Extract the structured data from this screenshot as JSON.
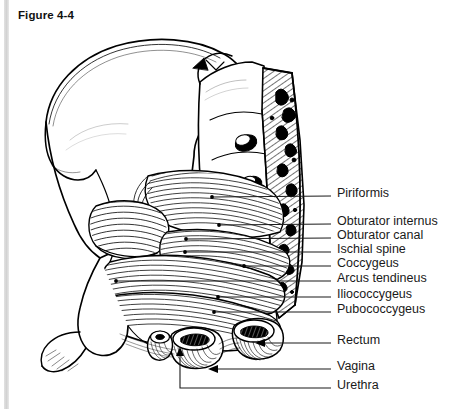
{
  "figure": {
    "title": "Figure 4-4",
    "background_color": "#ffffff",
    "ink_color": "#000000",
    "gutter_color": "#dcdcdc"
  },
  "labels": [
    {
      "id": "piriformis",
      "text": "Piriformis",
      "text_x": 337,
      "text_y": 196,
      "line_x1": 306,
      "line_y1": 196,
      "line_x2": 331,
      "line_y2": 196,
      "marker_x": 212,
      "marker_y": 197
    },
    {
      "id": "obturator-internus",
      "text": "Obturator internus",
      "text_x": 337,
      "text_y": 224,
      "line_x1": 300,
      "line_y1": 224,
      "line_x2": 331,
      "line_y2": 224,
      "marker_x": 219,
      "marker_y": 225
    },
    {
      "id": "obturator-canal",
      "text": "Obturator canal",
      "text_x": 337,
      "text_y": 238,
      "line_x1": 299,
      "line_y1": 238,
      "line_x2": 331,
      "line_y2": 238,
      "marker_x": 186,
      "marker_y": 239
    },
    {
      "id": "ischial-spine",
      "text": "Ischial spine",
      "text_x": 337,
      "text_y": 252,
      "line_x1": 298,
      "line_y1": 252,
      "line_x2": 331,
      "line_y2": 252,
      "marker_x": 185,
      "marker_y": 252
    },
    {
      "id": "coccygeus",
      "text": "Coccygeus",
      "text_x": 337,
      "text_y": 266,
      "line_x1": 298,
      "line_y1": 266,
      "line_x2": 331,
      "line_y2": 266,
      "marker_x": 244,
      "marker_y": 266
    },
    {
      "id": "arcus-tendineus",
      "text": "Arcus tendineus",
      "text_x": 337,
      "text_y": 281,
      "line_x1": 296,
      "line_y1": 281,
      "line_x2": 331,
      "line_y2": 281,
      "marker_x": 116,
      "marker_y": 281
    },
    {
      "id": "iliococcygeus",
      "text": "Iliococcygeus",
      "text_x": 337,
      "text_y": 297,
      "line_x1": 293,
      "line_y1": 297,
      "line_x2": 331,
      "line_y2": 297,
      "marker_x": 218,
      "marker_y": 297
    },
    {
      "id": "pubococcygeus",
      "text": "Pubococcygeus",
      "text_x": 337,
      "text_y": 312,
      "line_x1": 288,
      "line_y1": 312,
      "line_x2": 331,
      "line_y2": 312,
      "marker_x": 214,
      "marker_y": 312
    },
    {
      "id": "rectum",
      "text": "Rectum",
      "text_x": 337,
      "text_y": 343,
      "line_x1": 302,
      "line_y1": 343,
      "line_x2": 331,
      "line_y2": 343,
      "marker_x": 262,
      "marker_y": 343
    },
    {
      "id": "vagina",
      "text": "Vagina",
      "text_x": 337,
      "text_y": 369,
      "line_x1": 302,
      "line_y1": 369,
      "line_x2": 331,
      "line_y2": 369,
      "marker_x": 215,
      "marker_y": 369
    },
    {
      "id": "urethra",
      "text": "Urethra",
      "text_x": 337,
      "text_y": 388,
      "line_x1": 302,
      "line_y1": 388,
      "line_x2": 331,
      "line_y2": 388,
      "marker_x": 180,
      "marker_y": 388
    }
  ],
  "structures": [
    "ilium",
    "iliac-crest",
    "sacrum",
    "sacral-foramina",
    "cut-bone-surface",
    "ischial-spine",
    "pubic-bone",
    "piriformis-muscle",
    "obturator-internus-muscle",
    "coccygeus-muscle",
    "iliococcygeus-muscle",
    "pubococcygeus-muscle",
    "rectum-stump",
    "vagina-stump",
    "urethra-stump"
  ]
}
